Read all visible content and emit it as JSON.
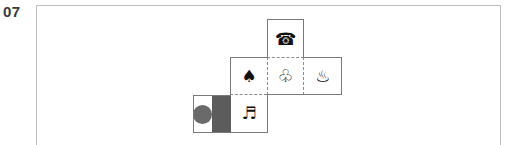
{
  "question": {
    "number": "07"
  },
  "net": {
    "description": "Cube net with six faces",
    "faces": [
      {
        "id": "top",
        "symbol": "☎",
        "icon": "telephone-icon"
      },
      {
        "id": "middle-left",
        "symbol": "♠",
        "icon": "spade-icon"
      },
      {
        "id": "middle-center",
        "symbol": "♧",
        "icon": "club-outline-icon"
      },
      {
        "id": "middle-right",
        "symbol": "♨",
        "icon": "hot-springs-icon"
      },
      {
        "id": "bottom-left",
        "symbol": "",
        "icon": "circle-and-band-pattern"
      },
      {
        "id": "bottom-center",
        "symbol": "♬",
        "icon": "music-notes-icon"
      }
    ],
    "colors": {
      "band": "#5c5c5c",
      "circle": "#6a6a6a",
      "frame": "#bdbdbd"
    }
  }
}
